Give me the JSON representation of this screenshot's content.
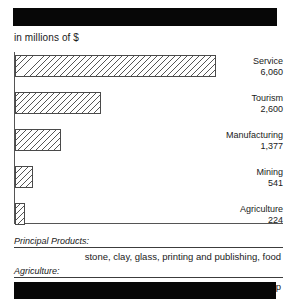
{
  "banners": {
    "top": {
      "name": "redacted-title-banner",
      "text": "",
      "color": "#070707"
    },
    "bottom": {
      "name": "redacted-footer-banner",
      "text": "",
      "color": "#070707"
    }
  },
  "units_caption": "in millions of $",
  "chart_data": {
    "type": "bar",
    "orientation": "horizontal",
    "title": "",
    "subtitle": "in millions of $",
    "xlabel": "",
    "ylabel": "",
    "grid": false,
    "legend": "none",
    "axis_line_color": "#555555",
    "bar_fill": "diagonal-hatch",
    "bar_outline": "#4a4a4a",
    "xlim": [
      0,
      7500
    ],
    "categories": [
      "Service",
      "Tourism",
      "Manufacturing",
      "Mining",
      "Agriculture"
    ],
    "values": [
      6060,
      2600,
      1377,
      541,
      224
    ],
    "value_labels": [
      "6,060",
      "2,600",
      "1,377",
      "541",
      "224"
    ]
  },
  "products": [
    {
      "header": "Principal Products:",
      "value": "stone, clay, glass, printing and publishing, food"
    },
    {
      "header": "Agriculture:",
      "value": "cattle, hay, dairy products, sheep"
    }
  ]
}
